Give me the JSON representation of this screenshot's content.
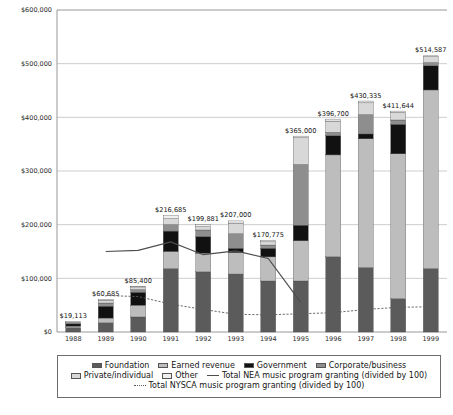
{
  "chart_data": {
    "type": "bar",
    "stacked": true,
    "title": "",
    "xlabel": "",
    "ylabel": "",
    "ylim": [
      0,
      600000
    ],
    "yticks": [
      0,
      100000,
      200000,
      300000,
      400000,
      500000,
      600000
    ],
    "ytick_labels": [
      "$0",
      "$100,000",
      "$200,000",
      "$300,000",
      "$400,000",
      "$500,000",
      "$600,000"
    ],
    "grid": true,
    "legend_position": "bottom",
    "categories": [
      "1988",
      "1989",
      "1990",
      "1991",
      "1992",
      "1993",
      "1994",
      "1995",
      "1996",
      "1997",
      "1998",
      "1999"
    ],
    "totals": [
      19113,
      60685,
      85400,
      216685,
      199881,
      207000,
      170775,
      365000,
      396700,
      430335,
      411644,
      514587
    ],
    "total_labels": [
      "$19,113",
      "$60,685",
      "$85,400",
      "$216,685",
      "$199,881",
      "$207,000",
      "$170,775",
      "$365,000",
      "$396,700",
      "$430,335",
      "$411,644",
      "$514,587"
    ],
    "series": [
      {
        "name": "Foundation",
        "color": "#5b5b5b",
        "values": [
          8000,
          17000,
          28000,
          118000,
          112000,
          108000,
          95000,
          95000,
          140000,
          120000,
          62000,
          118000
        ]
      },
      {
        "name": "Earned revenue",
        "color": "#bdbdbd",
        "values": [
          3000,
          9000,
          22000,
          32000,
          35000,
          40000,
          45000,
          75000,
          190000,
          240000,
          270000,
          333000
        ]
      },
      {
        "name": "Government",
        "color": "#111111",
        "values": [
          4000,
          22000,
          24000,
          38000,
          31000,
          8000,
          16000,
          29000,
          36000,
          9000,
          55000,
          45000
        ]
      },
      {
        "name": "Corporate/business",
        "color": "#8e8e8e",
        "values": [
          2000,
          6000,
          5000,
          12000,
          12000,
          27000,
          6000,
          113000,
          6000,
          36000,
          8000,
          6000
        ]
      },
      {
        "name": "Private/individual",
        "color": "#d8d8d8",
        "values": [
          1500,
          5000,
          5000,
          11000,
          6000,
          20000,
          6000,
          50000,
          21000,
          22000,
          14000,
          11000
        ]
      },
      {
        "name": "Other",
        "color": "#efefef",
        "values": [
          613,
          1685,
          1400,
          5685,
          3881,
          4000,
          2775,
          3000,
          3700,
          3335,
          2644,
          1587
        ]
      }
    ],
    "overlay_lines": [
      {
        "name": "Total NEA music program granting (divided by 100)",
        "style": "solid",
        "color": "#4d4d4d",
        "x": [
          "1989",
          "1990",
          "1991",
          "1992",
          "1993",
          "1994",
          "1995"
        ],
        "values": [
          150000,
          152000,
          168000,
          144000,
          151000,
          137000,
          55000
        ]
      },
      {
        "name": "Total NYSCA music program granting (divided by 100)",
        "style": "dotted",
        "color": "#5a5a5a",
        "x": [
          "1989",
          "1990",
          "1991",
          "1992",
          "1993",
          "1994",
          "1995",
          "1996",
          "1997",
          "1998",
          "1999"
        ],
        "values": [
          68000,
          66000,
          52000,
          42000,
          33000,
          32000,
          34000,
          36000,
          42000,
          46000,
          47000
        ]
      }
    ]
  },
  "legend": {
    "rows": [
      [
        {
          "label": "Foundation",
          "kind": "swatch",
          "color": "#5b5b5b",
          "icon": "legend-swatch-icon"
        },
        {
          "label": "Earned revenue",
          "kind": "swatch",
          "color": "#bdbdbd",
          "icon": "legend-swatch-icon"
        },
        {
          "label": "Government",
          "kind": "swatch",
          "color": "#111111",
          "icon": "legend-swatch-icon"
        },
        {
          "label": "Corporate/business",
          "kind": "swatch",
          "color": "#8e8e8e",
          "icon": "legend-swatch-icon"
        }
      ],
      [
        {
          "label": "Private/individual",
          "kind": "swatch",
          "color": "#d8d8d8",
          "icon": "legend-swatch-icon"
        },
        {
          "label": "Other",
          "kind": "swatch",
          "color": "#efefef",
          "icon": "legend-swatch-icon"
        },
        {
          "label": "Total NEA music program granting (divided by 100)",
          "kind": "line",
          "color": "#4d4d4d",
          "icon": "legend-solid-line-icon"
        }
      ],
      [
        {
          "label": "Total NYSCA music program granting (divided by 100)",
          "kind": "dotted",
          "color": "#5a5a5a",
          "icon": "legend-dotted-line-icon"
        }
      ]
    ]
  }
}
